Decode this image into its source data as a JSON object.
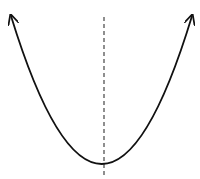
{
  "diagram": {
    "type": "parabola",
    "curve": {
      "start": [
        11,
        16
      ],
      "control": [
        102,
        312
      ],
      "end": [
        192,
        16
      ],
      "vertex": [
        102,
        164
      ],
      "stroke": "#111111",
      "stroke_width": 1.8,
      "arrowheads": [
        "left-end",
        "right-end"
      ]
    },
    "axis_of_symmetry": {
      "x": 104,
      "y_start": 17,
      "y_end": 176,
      "style": "dashed",
      "stroke": "#333333"
    },
    "background": "#ffffff"
  }
}
